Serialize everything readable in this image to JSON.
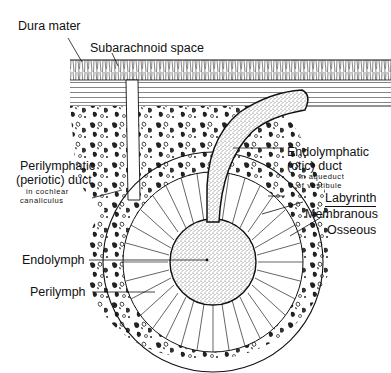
{
  "figure": {
    "labels": {
      "dura_mater": "Dura mater",
      "subarachnoid_space": "Subarachnoid space",
      "endolymphatic_duct_line1": "Endolymphatic",
      "endolymphatic_duct_line2": "(otic) duct",
      "endolymphatic_duct_sub1": "in aqueduct",
      "endolymphatic_duct_sub2": "of vestibule",
      "perilymphatic_duct_line1": "Perilymphatic",
      "perilymphatic_duct_line2": "(periotic) duct",
      "perilymphatic_duct_sub1": "in cochlear",
      "perilymphatic_duct_sub2": "canaliculus",
      "labyrinth": "Labyrinth",
      "membranous": "Membranous",
      "osseous": "Osseous",
      "endolymph": "Endolymph",
      "perilymph": "Perilymph"
    },
    "colors": {
      "ink": "#111111",
      "background": "#ffffff",
      "stipple": "#9a9a9a"
    }
  }
}
